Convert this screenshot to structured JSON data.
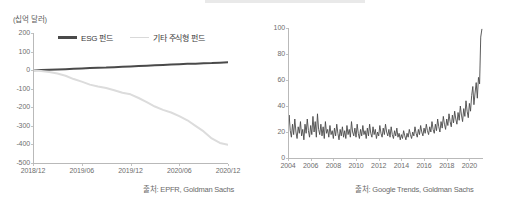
{
  "figure": {
    "panels": [
      {
        "id": "fund-flows",
        "axis_title": "(십억 달러)",
        "source": "출처: EPFR, Goldman Sachs",
        "legend": [
          {
            "label": "ESG 펀드",
            "color": "#4a4a4a"
          },
          {
            "label": "기타 주식형 펀드",
            "color": "#d9d9d9"
          }
        ]
      },
      {
        "id": "search-interest",
        "source": "출처: Google Trends, Goldman Sachs"
      }
    ]
  },
  "chart_data": [
    {
      "type": "line",
      "id": "fund-flows",
      "title": "",
      "xlabel": "",
      "ylabel": "(십억 달러)",
      "ylim": [
        -500,
        200
      ],
      "yticks": [
        200,
        100,
        0,
        -100,
        -200,
        -300,
        -400,
        -500
      ],
      "ytick_labels": [
        "200",
        "100",
        "0",
        "-100",
        "-200",
        "-300",
        "-400",
        "-500"
      ],
      "xlim": [
        0,
        24
      ],
      "xticks": [
        0,
        6,
        12,
        18,
        24
      ],
      "xtick_labels": [
        "2018/12",
        "2019/06",
        "2019/12",
        "2020/06",
        "2020/12"
      ],
      "grid": false,
      "legend_position": "top-left",
      "x": [
        0,
        1,
        2,
        3,
        4,
        5,
        6,
        7,
        8,
        9,
        10,
        11,
        12,
        13,
        14,
        15,
        16,
        17,
        18,
        19,
        20,
        21,
        22,
        23,
        24
      ],
      "series": [
        {
          "name": "ESG 펀드",
          "color": "#4a4a4a",
          "values": [
            0,
            1,
            2,
            4,
            5,
            7,
            9,
            11,
            13,
            14,
            16,
            18,
            20,
            22,
            24,
            26,
            28,
            30,
            32,
            34,
            35,
            37,
            38,
            40,
            42
          ]
        },
        {
          "name": "기타 주식형 펀드",
          "color": "#dcdcdc",
          "values": [
            0,
            -4,
            -10,
            -18,
            -30,
            -48,
            -62,
            -78,
            -88,
            -96,
            -108,
            -122,
            -130,
            -150,
            -172,
            -196,
            -214,
            -228,
            -248,
            -270,
            -300,
            -330,
            -368,
            -392,
            -402
          ]
        }
      ]
    },
    {
      "type": "line",
      "id": "search-interest",
      "title": "",
      "xlabel": "",
      "ylabel": "",
      "ylim": [
        0,
        100
      ],
      "yticks": [
        0,
        20,
        40,
        60,
        80,
        100
      ],
      "ytick_labels": [
        "0",
        "20",
        "40",
        "60",
        "80",
        "100"
      ],
      "xlim": [
        2004,
        2021.2
      ],
      "xticks": [
        2004,
        2006,
        2008,
        2010,
        2012,
        2014,
        2016,
        2018,
        2020
      ],
      "xtick_labels": [
        "2004",
        "2006",
        "2008",
        "2010",
        "2012",
        "2014",
        "2016",
        "2018",
        "2020"
      ],
      "grid": false,
      "series": [
        {
          "name": "ESG search interest",
          "color": "#4a4a4a",
          "x": [
            2004.0,
            2004.1,
            2004.2,
            2004.3,
            2004.4,
            2004.5,
            2004.6,
            2004.7,
            2004.8,
            2004.9,
            2005.0,
            2005.1,
            2005.2,
            2005.3,
            2005.4,
            2005.5,
            2005.6,
            2005.7,
            2005.8,
            2005.9,
            2006.0,
            2006.1,
            2006.2,
            2006.3,
            2006.4,
            2006.5,
            2006.6,
            2006.7,
            2006.8,
            2006.9,
            2007.0,
            2007.1,
            2007.2,
            2007.3,
            2007.4,
            2007.5,
            2007.6,
            2007.7,
            2007.8,
            2007.9,
            2008.0,
            2008.1,
            2008.2,
            2008.3,
            2008.4,
            2008.5,
            2008.6,
            2008.7,
            2008.8,
            2008.9,
            2009.0,
            2009.1,
            2009.2,
            2009.3,
            2009.4,
            2009.5,
            2009.6,
            2009.7,
            2009.8,
            2009.9,
            2010.0,
            2010.1,
            2010.2,
            2010.3,
            2010.4,
            2010.5,
            2010.6,
            2010.7,
            2010.8,
            2010.9,
            2011.0,
            2011.1,
            2011.2,
            2011.3,
            2011.4,
            2011.5,
            2011.6,
            2011.7,
            2011.8,
            2011.9,
            2012.0,
            2012.1,
            2012.2,
            2012.3,
            2012.4,
            2012.5,
            2012.6,
            2012.7,
            2012.8,
            2012.9,
            2013.0,
            2013.1,
            2013.2,
            2013.3,
            2013.4,
            2013.5,
            2013.6,
            2013.7,
            2013.8,
            2013.9,
            2014.0,
            2014.1,
            2014.2,
            2014.3,
            2014.4,
            2014.5,
            2014.6,
            2014.7,
            2014.8,
            2014.9,
            2015.0,
            2015.1,
            2015.2,
            2015.3,
            2015.4,
            2015.5,
            2015.6,
            2015.7,
            2015.8,
            2015.9,
            2016.0,
            2016.1,
            2016.2,
            2016.3,
            2016.4,
            2016.5,
            2016.6,
            2016.7,
            2016.8,
            2016.9,
            2017.0,
            2017.1,
            2017.2,
            2017.3,
            2017.4,
            2017.5,
            2017.6,
            2017.7,
            2017.8,
            2017.9,
            2018.0,
            2018.1,
            2018.2,
            2018.3,
            2018.4,
            2018.5,
            2018.6,
            2018.7,
            2018.8,
            2018.9,
            2019.0,
            2019.1,
            2019.2,
            2019.3,
            2019.4,
            2019.5,
            2019.6,
            2019.7,
            2019.8,
            2019.9,
            2020.0,
            2020.1,
            2020.2,
            2020.3,
            2020.4,
            2020.5,
            2020.6,
            2020.7,
            2020.8,
            2020.9,
            2021.0,
            2021.1
          ],
          "values": [
            18,
            33,
            21,
            16,
            26,
            18,
            30,
            20,
            15,
            24,
            19,
            28,
            17,
            22,
            14,
            26,
            19,
            30,
            21,
            16,
            25,
            18,
            32,
            20,
            28,
            16,
            34,
            22,
            18,
            26,
            17,
            24,
            15,
            28,
            19,
            22,
            16,
            25,
            18,
            21,
            15,
            23,
            17,
            26,
            19,
            14,
            22,
            17,
            24,
            16,
            21,
            15,
            25,
            18,
            22,
            16,
            28,
            20,
            17,
            23,
            16,
            26,
            19,
            15,
            22,
            17,
            25,
            18,
            21,
            15,
            23,
            17,
            26,
            19,
            16,
            24,
            18,
            22,
            15,
            20,
            17,
            25,
            19,
            16,
            23,
            18,
            26,
            20,
            17,
            22,
            16,
            24,
            18,
            15,
            21,
            17,
            23,
            16,
            19,
            14,
            18,
            15,
            21,
            17,
            14,
            19,
            16,
            22,
            18,
            15,
            20,
            17,
            24,
            19,
            16,
            22,
            18,
            25,
            20,
            17,
            23,
            19,
            26,
            21,
            18,
            24,
            20,
            28,
            22,
            19,
            26,
            21,
            30,
            24,
            20,
            28,
            23,
            32,
            26,
            22,
            30,
            25,
            34,
            28,
            24,
            33,
            27,
            36,
            30,
            26,
            35,
            29,
            40,
            33,
            28,
            38,
            32,
            44,
            36,
            31,
            42,
            36,
            48,
            55,
            41,
            50,
            58,
            46,
            62,
            57,
            93,
            99
          ]
        }
      ]
    }
  ]
}
